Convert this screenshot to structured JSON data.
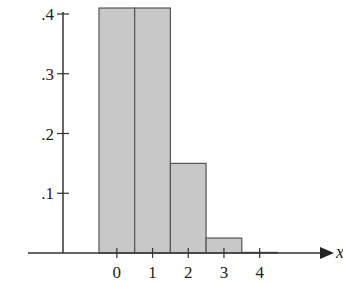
{
  "chart_data": {
    "type": "bar",
    "title": "",
    "xlabel": "x",
    "ylabel": "",
    "categories": [
      "0",
      "1",
      "2",
      "3",
      "4"
    ],
    "values": [
      0.41,
      0.41,
      0.15,
      0.025,
      0.001
    ],
    "ylim": [
      0,
      0.4
    ],
    "yticks": [
      ".1",
      ".2",
      ".3",
      ".4"
    ],
    "xticks": [
      "0",
      "1",
      "2",
      "3",
      "4"
    ],
    "grid": false,
    "legend": "none",
    "bar_color": "#c8c8c8",
    "edge_color": "#555555"
  }
}
